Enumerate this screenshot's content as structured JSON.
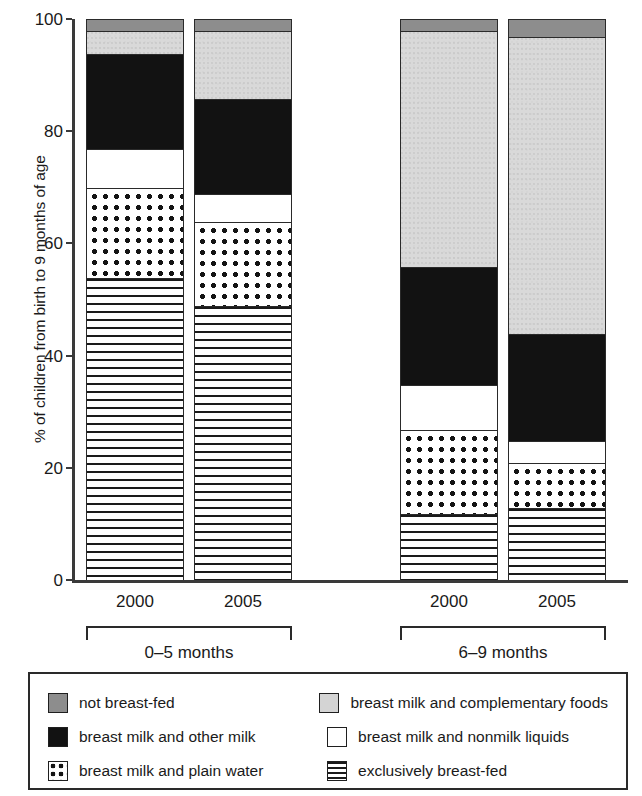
{
  "chart_data": {
    "type": "bar",
    "stacked": true,
    "title": "",
    "xlabel": "",
    "ylabel": "% of children from birth to 9 months of age",
    "ylim": [
      0,
      100
    ],
    "yticks": [
      0,
      20,
      40,
      60,
      80,
      100
    ],
    "ytick_labels": [
      "0",
      "20",
      "40",
      "60",
      "80",
      "100"
    ],
    "grid": false,
    "legend_position": "bottom",
    "categories": [
      "2000",
      "2005",
      "2000",
      "2005"
    ],
    "groups": [
      {
        "label": "0–5 months",
        "categories": [
          "2000",
          "2005"
        ]
      },
      {
        "label": "6–9 months",
        "categories": [
          "2000",
          "2005"
        ]
      }
    ],
    "series": [
      {
        "name": "exclusively breast-fed",
        "key": "excl",
        "color": "#ffffff",
        "pattern": "horizontal-lines",
        "values": [
          54,
          49,
          12,
          13
        ]
      },
      {
        "name": "breast milk and plain water",
        "key": "water",
        "color": "#ffffff",
        "pattern": "dots",
        "values": [
          16,
          15,
          15,
          8
        ]
      },
      {
        "name": "breast milk and nonmilk liquids",
        "key": "nonmilk",
        "color": "#ffffff",
        "pattern": "solid",
        "values": [
          7,
          5,
          8,
          4
        ]
      },
      {
        "name": "breast milk and other milk",
        "key": "othermilk",
        "color": "#121212",
        "pattern": "solid",
        "values": [
          17,
          17,
          21,
          19
        ]
      },
      {
        "name": "breast milk and complementary foods",
        "key": "compl",
        "color": "#d9d9d9",
        "pattern": "speckle",
        "values": [
          4,
          12,
          42,
          53
        ]
      },
      {
        "name": "not breast-fed",
        "key": "notbf",
        "color": "#8d8d8d",
        "pattern": "solid",
        "values": [
          2,
          2,
          2,
          3
        ]
      }
    ],
    "cumulative_tops": [
      [
        54,
        70,
        77,
        94,
        98,
        100
      ],
      [
        49,
        64,
        69,
        86,
        98,
        100
      ],
      [
        12,
        27,
        35,
        56,
        98,
        100
      ],
      [
        13,
        21,
        25,
        44,
        97,
        100
      ]
    ]
  },
  "legend": {
    "rows": [
      {
        "left": {
          "key": "notbf",
          "label": "not breast-fed"
        },
        "right": {
          "key": "compl",
          "label": "breast milk and complementary foods"
        }
      },
      {
        "left": {
          "key": "othermilk",
          "label": "breast milk and other milk"
        },
        "right": {
          "key": "nonmilk",
          "label": "breast milk and nonmilk liquids"
        }
      },
      {
        "left": {
          "key": "water",
          "label": "breast milk and plain water"
        },
        "right": {
          "key": "excl",
          "label": "exclusively breast-fed"
        }
      }
    ]
  },
  "axis": {
    "y_title": "% of children from birth to 9 months of age",
    "ticks": [
      "100",
      "80",
      "60",
      "40",
      "20",
      "0"
    ]
  },
  "xlabels": [
    "2000",
    "2005",
    "2000",
    "2005"
  ],
  "group_labels": [
    "0–5 months",
    "6–9 months"
  ],
  "colors": {
    "not_breast_fed": "#8d8d8d",
    "complementary_foods": "#d9d9d9",
    "other_milk": "#121212",
    "nonmilk_liquids": "#ffffff",
    "plain_water": "#ffffff",
    "exclusive": "#ffffff",
    "axis": "#3a3a3a",
    "outline": "#2a2a2a"
  }
}
